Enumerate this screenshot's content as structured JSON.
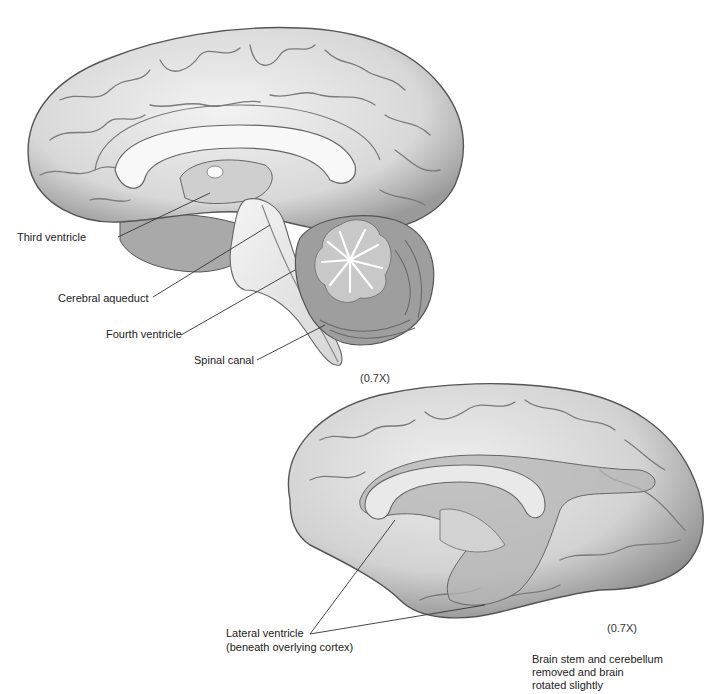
{
  "figure_top": {
    "description": "Midsagittal section of brain showing ventricles",
    "labels": {
      "third_ventricle": "Third ventricle",
      "cerebral_aqueduct": "Cerebral aqueduct",
      "fourth_ventricle": "Fourth ventricle",
      "spinal_canal": "Spinal canal"
    },
    "magnification": "(0.7X)"
  },
  "figure_bottom": {
    "description": "Medial view with brain stem and cerebellum removed",
    "labels": {
      "lateral_ventricle_line1": "Lateral ventricle",
      "lateral_ventricle_line2": "(beneath overlying cortex)"
    },
    "magnification": "(0.7X)",
    "caption_line1": "Brain stem and cerebellum",
    "caption_line2": "removed and brain",
    "caption_line3": "rotated slightly"
  },
  "colors": {
    "cortex_fill": "#e4e4e4",
    "cortex_shadow": "#8a8a8a",
    "ventricle_fill": "#b9b9b9",
    "corpus_callosum": "#f6f6f6",
    "cerebellum_gray": "#a8a8a8",
    "leader_line": "#333333"
  }
}
